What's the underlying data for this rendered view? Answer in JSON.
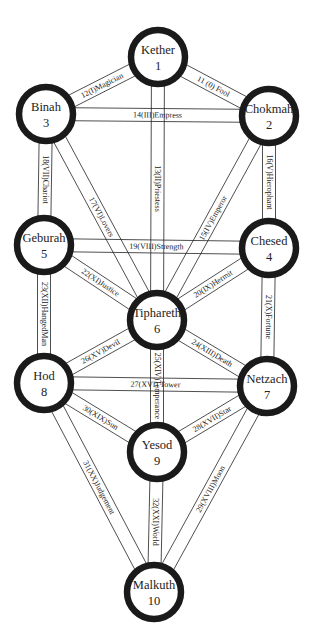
{
  "nodes": [
    {
      "id": 1,
      "name": "Kether",
      "number": "1",
      "x": 158,
      "y": 57
    },
    {
      "id": 2,
      "name": "Chokmah",
      "number": "2",
      "x": 269,
      "y": 116
    },
    {
      "id": 3,
      "name": "Binah",
      "number": "3",
      "x": 46,
      "y": 114
    },
    {
      "id": 4,
      "name": "Chesed",
      "number": "4",
      "x": 269,
      "y": 248
    },
    {
      "id": 5,
      "name": "Geburah",
      "number": "5",
      "x": 44,
      "y": 245
    },
    {
      "id": 6,
      "name": "Tiphareth",
      "number": "6",
      "x": 157,
      "y": 320
    },
    {
      "id": 7,
      "name": "Netzach",
      "number": "7",
      "x": 267,
      "y": 386
    },
    {
      "id": 8,
      "name": "Hod",
      "number": "8",
      "x": 44,
      "y": 383
    },
    {
      "id": 9,
      "name": "Yesod",
      "number": "9",
      "x": 157,
      "y": 452
    },
    {
      "id": 10,
      "name": "Malkuth",
      "number": "10",
      "x": 154,
      "y": 592
    }
  ],
  "paths": [
    {
      "from": 1,
      "to": 2,
      "label": "11 (0) Fool"
    },
    {
      "from": 1,
      "to": 3,
      "label": "12(I)Magician"
    },
    {
      "from": 1,
      "to": 6,
      "label": "13(II)Priestess"
    },
    {
      "from": 3,
      "to": 2,
      "label": "14(III)Empress"
    },
    {
      "from": 2,
      "to": 6,
      "label": "15(IV)Emperor"
    },
    {
      "from": 2,
      "to": 4,
      "label": "16(V)Hierophant"
    },
    {
      "from": 3,
      "to": 6,
      "label": "17(VI)Lovers"
    },
    {
      "from": 3,
      "to": 5,
      "label": "18(VII)Chariot"
    },
    {
      "from": 5,
      "to": 4,
      "label": "19(VIII)Strength"
    },
    {
      "from": 4,
      "to": 6,
      "label": "20(IX)Hermit"
    },
    {
      "from": 4,
      "to": 7,
      "label": "21(X)Fortune"
    },
    {
      "from": 5,
      "to": 6,
      "label": "22(XI)Justice"
    },
    {
      "from": 5,
      "to": 8,
      "label": "23(XII)HangedMan"
    },
    {
      "from": 6,
      "to": 7,
      "label": "24(XIII)Death"
    },
    {
      "from": 6,
      "to": 9,
      "label": "25(XIV)Temperance"
    },
    {
      "from": 6,
      "to": 8,
      "label": "26(XV)Devil"
    },
    {
      "from": 8,
      "to": 7,
      "label": "27(XVI) Tower"
    },
    {
      "from": 7,
      "to": 9,
      "label": "28(XVII)Star"
    },
    {
      "from": 7,
      "to": 10,
      "label": "29(XVIII)Moon"
    },
    {
      "from": 8,
      "to": 9,
      "label": "30(XIX)Sun"
    },
    {
      "from": 8,
      "to": 10,
      "label": "31(XX)Judgement"
    },
    {
      "from": 9,
      "to": 10,
      "label": "32(XXI)World"
    }
  ],
  "style": {
    "node_radius": 27,
    "path_width": 13,
    "ring_color": "#1a1a1a",
    "line_color": "#222222",
    "background": "#ffffff"
  }
}
